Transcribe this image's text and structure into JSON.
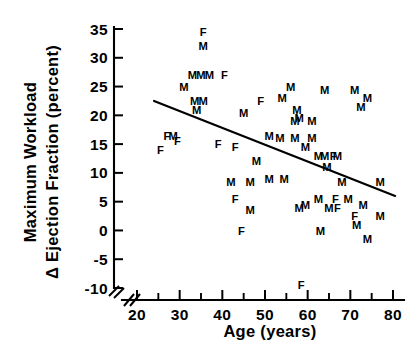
{
  "chart_data": {
    "type": "scatter",
    "title": "",
    "xlabel": "Age  (years)",
    "ylabel_line1": "Maximum Workload",
    "ylabel_line2": "Δ Ejection Fraction (percent)",
    "xlim": [
      17,
      82
    ],
    "ylim": [
      -12,
      36
    ],
    "xticks": [
      20,
      30,
      40,
      50,
      60,
      70,
      80
    ],
    "xtick_labels": [
      "20",
      "30",
      "40",
      "50",
      "60",
      "70",
      "80"
    ],
    "xminor_ticks": [
      25,
      35,
      45,
      55,
      65,
      75
    ],
    "yticks": [
      -10,
      -5,
      0,
      5,
      10,
      15,
      20,
      25,
      30,
      35
    ],
    "ytick_labels": [
      "-10",
      "-5",
      "0",
      "5",
      "10",
      "15",
      "20",
      "25",
      "30",
      "35"
    ],
    "grid": false,
    "legend": "none",
    "axis_break": {
      "axis": "both",
      "note": "double-slash break at origin corner"
    },
    "marker_style": "letter-glyph",
    "marker_meanings": {
      "M": "male",
      "F": "female"
    },
    "series": [
      {
        "name": "Male",
        "label": "M",
        "points": [
          [
            35.5,
            32.0
          ],
          [
            33.0,
            27.0
          ],
          [
            35.0,
            27.0
          ],
          [
            37.0,
            27.0
          ],
          [
            31.0,
            25.0
          ],
          [
            33.5,
            22.5
          ],
          [
            35.5,
            22.5
          ],
          [
            34.0,
            21.0
          ],
          [
            45.0,
            20.5
          ],
          [
            56.0,
            25.0
          ],
          [
            54.0,
            23.0
          ],
          [
            57.5,
            21.0
          ],
          [
            64.0,
            24.5
          ],
          [
            71.0,
            24.5
          ],
          [
            74.0,
            23.0
          ],
          [
            72.5,
            21.5
          ],
          [
            58.0,
            19.5
          ],
          [
            28.5,
            16.5
          ],
          [
            51.0,
            16.5
          ],
          [
            53.5,
            16.0
          ],
          [
            57.0,
            19.0
          ],
          [
            61.0,
            19.0
          ],
          [
            57.0,
            16.0
          ],
          [
            61.0,
            16.0
          ],
          [
            59.5,
            14.5
          ],
          [
            62.5,
            13.0
          ],
          [
            64.0,
            13.0
          ],
          [
            67.0,
            13.0
          ],
          [
            64.5,
            11.0
          ],
          [
            48.0,
            12.0
          ],
          [
            42.0,
            8.5
          ],
          [
            46.5,
            8.5
          ],
          [
            51.0,
            9.0
          ],
          [
            54.5,
            9.0
          ],
          [
            68.0,
            8.5
          ],
          [
            77.0,
            8.5
          ],
          [
            62.5,
            5.5
          ],
          [
            59.5,
            4.5
          ],
          [
            65.0,
            4.0
          ],
          [
            69.5,
            5.5
          ],
          [
            73.0,
            4.5
          ],
          [
            58.0,
            4.0
          ],
          [
            46.5,
            3.5
          ],
          [
            77.0,
            2.5
          ],
          [
            71.5,
            1.0
          ],
          [
            63.0,
            0.0
          ],
          [
            74.0,
            -1.5
          ]
        ]
      },
      {
        "name": "Female",
        "label": "F",
        "points": [
          [
            35.5,
            34.5
          ],
          [
            40.5,
            27.0
          ],
          [
            49.0,
            22.5
          ],
          [
            27.0,
            16.5
          ],
          [
            29.5,
            15.5
          ],
          [
            25.5,
            14.0
          ],
          [
            39.0,
            15.0
          ],
          [
            43.0,
            14.5
          ],
          [
            66.0,
            13.0
          ],
          [
            66.5,
            5.5
          ],
          [
            67.0,
            4.0
          ],
          [
            43.0,
            5.5
          ],
          [
            71.0,
            2.5
          ],
          [
            44.5,
            0.0
          ],
          [
            58.5,
            -9.5
          ]
        ]
      }
    ],
    "regression_line": {
      "x_start": 24.0,
      "y_start": 22.5,
      "x_end": 80.5,
      "y_end": 6.0,
      "style": "solid"
    }
  }
}
